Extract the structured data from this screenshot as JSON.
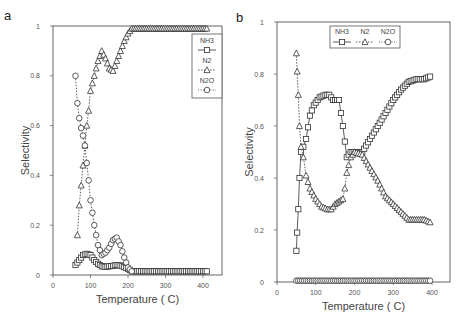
{
  "chart_data": [
    {
      "panel": "a",
      "type": "line",
      "title": "",
      "xlabel": "Temperature ( C)",
      "ylabel": "Selectivity",
      "xlim": [
        0,
        450
      ],
      "ylim": [
        0,
        1
      ],
      "xticks": [
        0,
        100,
        200,
        300,
        400
      ],
      "yticks": [
        0,
        0.2,
        0.4,
        0.6,
        0.8,
        1
      ],
      "ytick_labels": [
        "0",
        "0.2",
        "0.4",
        "0.6",
        "0.8",
        "1"
      ],
      "legend": {
        "position": "upper right (vertical)",
        "entries": [
          "NH3",
          "N2",
          "N2O"
        ]
      },
      "series": [
        {
          "name": "NH3",
          "marker": "square",
          "line": "solid",
          "x": [
            60,
            70,
            80,
            90,
            100,
            110,
            120,
            130,
            140,
            150,
            160,
            170,
            180,
            190,
            200,
            210,
            250,
            300,
            350,
            410
          ],
          "y": [
            0.04,
            0.06,
            0.08,
            0.085,
            0.08,
            0.06,
            0.045,
            0.035,
            0.033,
            0.035,
            0.037,
            0.04,
            0.038,
            0.032,
            0.025,
            0.015,
            0.015,
            0.015,
            0.015,
            0.015
          ]
        },
        {
          "name": "N2",
          "marker": "triangle",
          "line": "dotted",
          "x": [
            65,
            70,
            75,
            80,
            85,
            90,
            95,
            100,
            110,
            120,
            130,
            140,
            150,
            160,
            170,
            180,
            190,
            200,
            210,
            250,
            300,
            350,
            410
          ],
          "y": [
            0.16,
            0.28,
            0.36,
            0.44,
            0.52,
            0.6,
            0.66,
            0.74,
            0.8,
            0.86,
            0.9,
            0.87,
            0.83,
            0.82,
            0.86,
            0.9,
            0.94,
            0.97,
            0.99,
            0.99,
            0.99,
            0.99,
            0.99
          ]
        },
        {
          "name": "N2O",
          "marker": "circle",
          "line": "dotted",
          "x": [
            60,
            65,
            70,
            75,
            80,
            85,
            90,
            95,
            100,
            110,
            120,
            130,
            140,
            150,
            160,
            170,
            180,
            190,
            200,
            210
          ],
          "y": [
            0.8,
            0.69,
            0.63,
            0.59,
            0.56,
            0.52,
            0.45,
            0.38,
            0.3,
            0.2,
            0.12,
            0.08,
            0.09,
            0.11,
            0.14,
            0.15,
            0.12,
            0.07,
            0.03,
            0.015
          ]
        }
      ]
    },
    {
      "panel": "b",
      "type": "line",
      "title": "",
      "xlabel": "Temperature ( C)",
      "ylabel": "Selectivity",
      "xlim": [
        0,
        450
      ],
      "ylim": [
        0,
        1
      ],
      "xticks": [
        0,
        100,
        200,
        300,
        400
      ],
      "yticks": [
        0,
        0.2,
        0.4,
        0.6,
        0.8,
        1
      ],
      "ytick_labels": [
        "0",
        "0.2",
        "0.4",
        "0.6",
        "0.8",
        "1"
      ],
      "legend": {
        "position": "upper center (horizontal)",
        "entries": [
          "NH3",
          "N2",
          "N2O"
        ]
      },
      "series": [
        {
          "name": "NH3",
          "marker": "square",
          "line": "solid",
          "x": [
            50,
            52,
            55,
            58,
            62,
            68,
            75,
            85,
            95,
            110,
            125,
            135,
            145,
            160,
            170,
            180,
            190,
            200,
            220,
            240,
            260,
            280,
            300,
            320,
            340,
            360,
            380,
            395
          ],
          "y": [
            0.12,
            0.19,
            0.28,
            0.4,
            0.5,
            0.52,
            0.55,
            0.64,
            0.68,
            0.71,
            0.72,
            0.72,
            0.7,
            0.7,
            0.6,
            0.48,
            0.5,
            0.5,
            0.5,
            0.55,
            0.6,
            0.65,
            0.7,
            0.74,
            0.77,
            0.78,
            0.78,
            0.79
          ]
        },
        {
          "name": "N2",
          "marker": "triangle",
          "line": "dotted",
          "x": [
            50,
            52,
            55,
            58,
            62,
            68,
            75,
            85,
            100,
            115,
            130,
            140,
            150,
            160,
            170,
            175,
            180,
            190,
            200,
            220,
            240,
            260,
            280,
            300,
            320,
            340,
            360,
            380,
            395
          ],
          "y": [
            0.88,
            0.81,
            0.72,
            0.6,
            0.52,
            0.48,
            0.41,
            0.36,
            0.32,
            0.29,
            0.28,
            0.28,
            0.3,
            0.31,
            0.32,
            0.36,
            0.42,
            0.48,
            0.5,
            0.49,
            0.44,
            0.39,
            0.33,
            0.3,
            0.27,
            0.24,
            0.24,
            0.24,
            0.23
          ]
        },
        {
          "name": "N2O",
          "marker": "circle",
          "line": "dotted",
          "x": [
            50,
            100,
            150,
            200,
            250,
            300,
            350,
            395
          ],
          "y": [
            0.005,
            0.005,
            0.005,
            0.005,
            0.005,
            0.005,
            0.005,
            0.005
          ]
        }
      ]
    }
  ],
  "labels": {
    "panel_a": "a",
    "panel_b": "b",
    "xlabel": "Temperature ( C)",
    "ylabel": "Selectivity",
    "legend": [
      "NH3",
      "N2",
      "N2O"
    ]
  }
}
